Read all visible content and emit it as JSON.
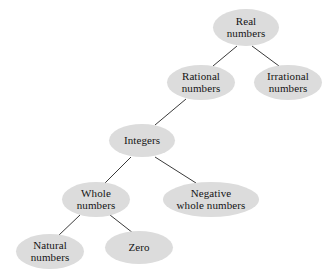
{
  "diagram": {
    "background_color": "#ffffff",
    "node_fill_color": "#dcdcdc",
    "node_text_color": "#141414",
    "edge_color": "#3a3a3a",
    "nodes": [
      {
        "id": "real-numbers",
        "label": "Real\nnumbers",
        "x": 213,
        "y": 9,
        "w": 66,
        "h": 37,
        "font_size": 11
      },
      {
        "id": "rational-numbers",
        "label": "Rational\nnumbers",
        "x": 167,
        "y": 65,
        "w": 68,
        "h": 35,
        "font_size": 11
      },
      {
        "id": "irrational-numbers",
        "label": "Irrational\nnumbers",
        "x": 254,
        "y": 65,
        "w": 68,
        "h": 35,
        "font_size": 11
      },
      {
        "id": "integers",
        "label": "Integers",
        "x": 109,
        "y": 124,
        "w": 66,
        "h": 33,
        "font_size": 11
      },
      {
        "id": "whole-numbers",
        "label": "Whole\nnumbers",
        "x": 62,
        "y": 182,
        "w": 68,
        "h": 35,
        "font_size": 11
      },
      {
        "id": "negative-whole-numbers",
        "label": "Negative\nwhole numbers",
        "x": 163,
        "y": 182,
        "w": 96,
        "h": 35,
        "font_size": 11
      },
      {
        "id": "natural-numbers",
        "label": "Natural\nnumbers",
        "x": 16,
        "y": 234,
        "w": 68,
        "h": 35,
        "font_size": 11
      },
      {
        "id": "zero",
        "label": "Zero",
        "x": 105,
        "y": 231,
        "w": 68,
        "h": 33,
        "font_size": 11
      }
    ],
    "edges": [
      {
        "id": "edge-real-rational",
        "from": "real-numbers",
        "to": "rational-numbers",
        "x1": 237,
        "y1": 46,
        "x2": 213,
        "y2": 66
      },
      {
        "id": "edge-real-irrational",
        "from": "real-numbers",
        "to": "irrational-numbers",
        "x1": 252,
        "y1": 46,
        "x2": 279,
        "y2": 66
      },
      {
        "id": "edge-rational-integers",
        "from": "rational-numbers",
        "to": "integers",
        "x1": 186,
        "y1": 99,
        "x2": 155,
        "y2": 125
      },
      {
        "id": "edge-integers-whole",
        "from": "integers",
        "to": "whole-numbers",
        "x1": 131,
        "y1": 157,
        "x2": 105,
        "y2": 183
      },
      {
        "id": "edge-integers-negative",
        "from": "integers",
        "to": "negative-whole-numbers",
        "x1": 155,
        "y1": 157,
        "x2": 196,
        "y2": 183
      },
      {
        "id": "edge-whole-natural",
        "from": "whole-numbers",
        "to": "natural-numbers",
        "x1": 80,
        "y1": 215,
        "x2": 58,
        "y2": 236
      },
      {
        "id": "edge-whole-zero",
        "from": "whole-numbers",
        "to": "zero",
        "x1": 110,
        "y1": 215,
        "x2": 133,
        "y2": 233
      }
    ]
  }
}
